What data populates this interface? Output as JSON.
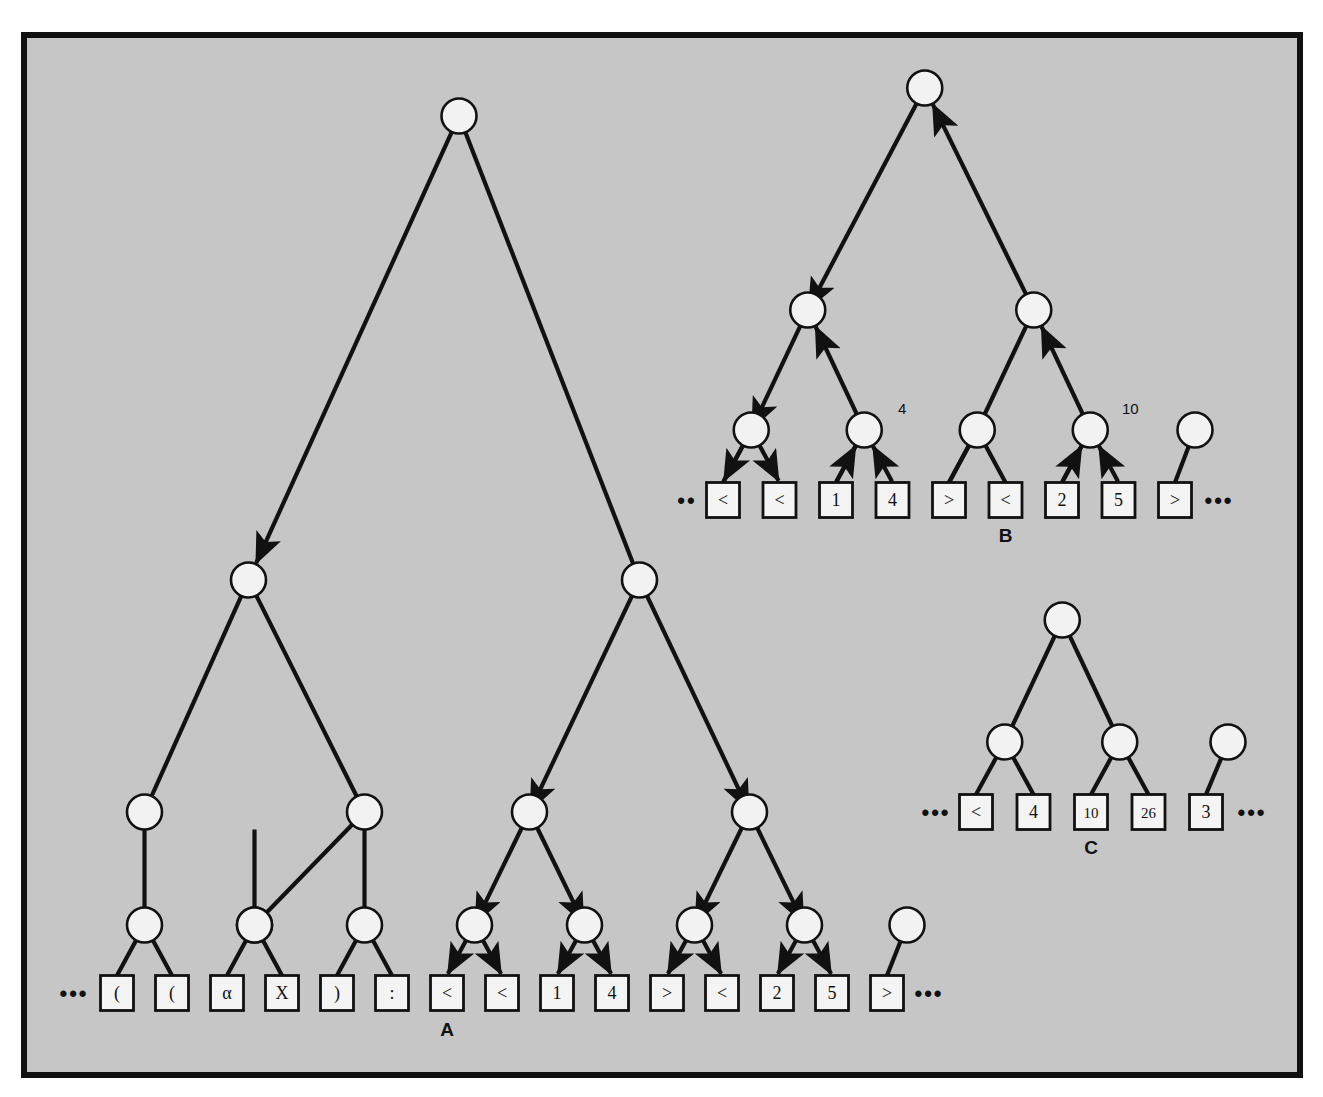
{
  "figure": {
    "kind": "parse-tree-diagram",
    "background_color": "#c6c6c6",
    "page_color": "#ffffff",
    "frame_color": "#111111",
    "node_fill": "#f2f2f2",
    "node_stroke": "#111111",
    "box_fill": "#f4f4f4",
    "box_stroke": "#111111",
    "edge_color": "#111111",
    "ellipsis_glyph": "•••",
    "node_icon_name": "tree-node-circle",
    "leaf_icon_name": "token-box"
  },
  "trees": [
    {
      "id": "A",
      "label": "A",
      "label_under_leaf_index": 6,
      "arrows": "down-on-right-subtree",
      "leaves": [
        {
          "text": "(",
          "has_edge": true
        },
        {
          "text": "(",
          "has_edge": true
        },
        {
          "text": "α",
          "has_edge": true
        },
        {
          "text": "X",
          "has_edge": true
        },
        {
          "text": ")",
          "has_edge": true
        },
        {
          "text": ":",
          "has_edge": true
        },
        {
          "text": "<",
          "has_edge": true
        },
        {
          "text": "<",
          "has_edge": true
        },
        {
          "text": "1",
          "has_edge": true
        },
        {
          "text": "4",
          "has_edge": true
        },
        {
          "text": ">",
          "has_edge": true
        },
        {
          "text": "<",
          "has_edge": true
        },
        {
          "text": "2",
          "has_edge": true
        },
        {
          "text": "5",
          "has_edge": true
        },
        {
          "text": ">",
          "has_edge": true
        }
      ],
      "leading_ellipsis": "•••",
      "trailing_ellipsis": "•••",
      "node_annotations": []
    },
    {
      "id": "B",
      "label": "B",
      "label_under_leaf_index": 5,
      "arrows": "down-left-up-right",
      "leaves": [
        {
          "text": "<"
        },
        {
          "text": "<"
        },
        {
          "text": "1"
        },
        {
          "text": "4"
        },
        {
          "text": ">"
        },
        {
          "text": "<"
        },
        {
          "text": "2"
        },
        {
          "text": "5"
        },
        {
          "text": ">"
        }
      ],
      "leading_ellipsis": "••",
      "trailing_ellipsis": "•••",
      "node_annotations": [
        {
          "text": "4",
          "attached_to": "node-l2-c1"
        },
        {
          "text": "10",
          "attached_to": "node-l2-c3"
        }
      ]
    },
    {
      "id": "C",
      "label": "C",
      "label_under_leaf_index": 2,
      "arrows": "none",
      "leaves": [
        {
          "text": "<"
        },
        {
          "text": "4"
        },
        {
          "text": "10"
        },
        {
          "text": "26"
        },
        {
          "text": "3"
        }
      ],
      "leading_ellipsis": "•••",
      "trailing_ellipsis": "•••",
      "node_annotations": []
    }
  ],
  "annotations": {
    "tree_a_label": "A",
    "tree_b_label": "B",
    "tree_c_label": "C",
    "b_node_value_1": "4",
    "b_node_value_2": "10"
  }
}
